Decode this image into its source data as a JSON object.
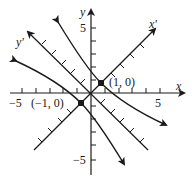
{
  "diagram": {
    "axes": {
      "x_label": "x",
      "y_label": "y",
      "x_prime_label": "x'",
      "y_prime_label": "y'",
      "x_tick_pos_label": "5",
      "x_tick_neg_label": "−5",
      "y_tick_pos_label": "5",
      "y_tick_neg_label": "−5",
      "range": [
        -5,
        5
      ],
      "rotation_degrees": 45
    },
    "points": [
      {
        "label": "(1, 0)",
        "x_prime": 1,
        "y_prime": 0
      },
      {
        "label": "(−1, 0)",
        "x_prime": -1,
        "y_prime": 0
      }
    ],
    "curve": {
      "type": "hyperbola",
      "equation_rotated": "x'^2 - y'^2 = 1"
    },
    "colors": {
      "ink": "#1a1a1a",
      "background": "#ffffff"
    }
  }
}
